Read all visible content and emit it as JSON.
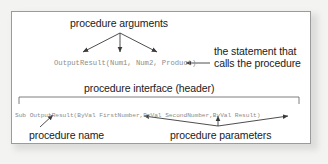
{
  "diagram": {
    "title_text": "procedure arguments",
    "labels": {
      "arguments": "procedure  arguments",
      "statement_line1": "the statement that",
      "statement_line2": "calls the procedure",
      "interface": "procedure interface (header)",
      "procedure_name": "procedure name",
      "procedure_parameters": "procedure parameters"
    },
    "code": {
      "call_statement": "OutputResult(Num1, Num2, Product)",
      "header_statement": "Sub OutputResult(ByVal FirstNumber,ByVal SecondNumber,ByVal Result)"
    },
    "colors": {
      "code_text": "#8c8c8c",
      "label_text": "#1a1a1a",
      "arrow": "#3a3a3a",
      "border": "#9b9b9b",
      "card_background": "#ffffff",
      "page_background": "#f3f3f1"
    }
  }
}
